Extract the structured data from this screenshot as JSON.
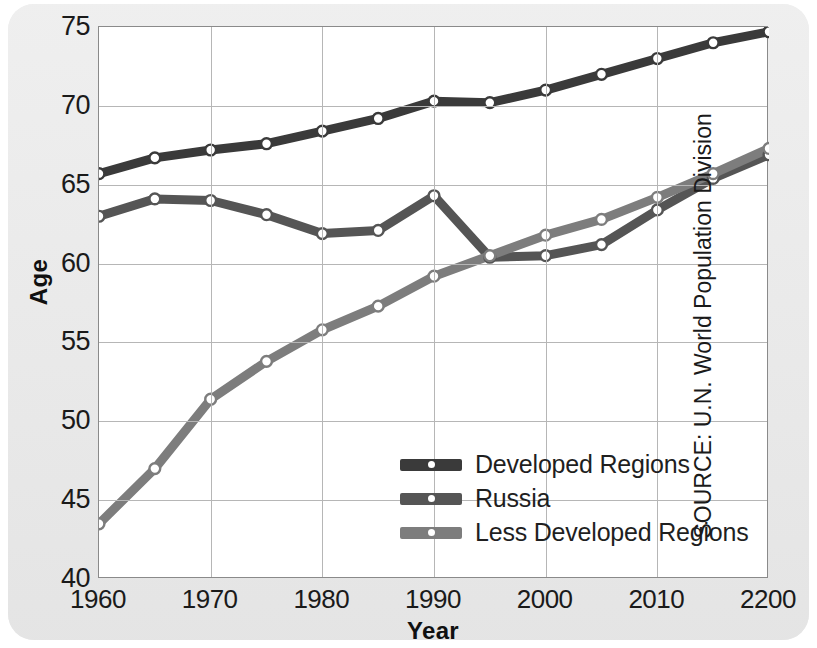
{
  "chart_data": {
    "type": "line",
    "title": "",
    "xlabel": "Year",
    "ylabel": "Age",
    "xlim": [
      1960,
      2020
    ],
    "ylim": [
      40,
      75
    ],
    "ytick_labels": [
      "75",
      "70",
      "65",
      "60",
      "55",
      "50",
      "45",
      "40"
    ],
    "ytick_values": [
      75,
      70,
      65,
      60,
      55,
      50,
      45,
      40
    ],
    "xtick_labels": [
      "1960",
      "1970",
      "1980",
      "1990",
      "2000",
      "2010",
      "2200"
    ],
    "xtick_values": [
      1960,
      1970,
      1980,
      1990,
      2000,
      2010,
      2020
    ],
    "grid": true,
    "legend_position": "center-right",
    "x": [
      1960,
      1965,
      1970,
      1975,
      1980,
      1985,
      1990,
      1995,
      2000,
      2005,
      2010,
      2015,
      2020
    ],
    "series": [
      {
        "name": "Developed Regions",
        "color": "#3a3a3a",
        "values": [
          65.7,
          66.7,
          67.2,
          67.6,
          68.4,
          69.2,
          70.3,
          70.2,
          71.0,
          72.0,
          73.0,
          74.0,
          74.7
        ]
      },
      {
        "name": "Russia",
        "color": "#555555",
        "values": [
          63.0,
          64.1,
          64.0,
          63.1,
          61.9,
          62.1,
          64.3,
          60.4,
          60.5,
          61.2,
          63.4,
          65.4,
          66.9
        ]
      },
      {
        "name": "Less Developed Regions",
        "color": "#7d7d7d",
        "values": [
          43.5,
          47.0,
          51.4,
          53.8,
          55.8,
          57.3,
          59.2,
          60.5,
          61.8,
          62.8,
          64.2,
          65.7,
          67.3
        ]
      }
    ],
    "source_note": "SOURCE: U.N. World Population Division"
  },
  "legend": {
    "items": [
      {
        "label": "Developed Regions"
      },
      {
        "label": "Russia"
      },
      {
        "label": "Less Developed Regions"
      }
    ]
  }
}
